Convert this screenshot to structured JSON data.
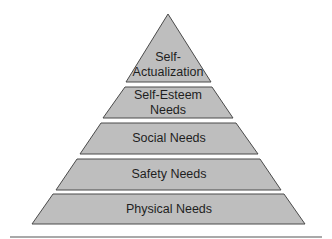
{
  "diagram": {
    "type": "pyramid",
    "fill_color": "#bebebe",
    "stroke_color": "#4a4a4a",
    "rule_color": "#8c8c8c",
    "tiers": [
      {
        "label": "Self-\nActualization",
        "level": 5
      },
      {
        "label": "Self-Esteem\nNeeds",
        "level": 4
      },
      {
        "label": "Social Needs",
        "level": 3
      },
      {
        "label": "Safety Needs",
        "level": 2
      },
      {
        "label": "Physical Needs",
        "level": 1
      }
    ]
  }
}
